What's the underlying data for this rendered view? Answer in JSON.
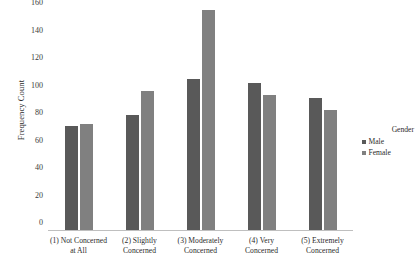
{
  "chart_data": {
    "type": "bar",
    "title": "",
    "xlabel": "",
    "ylabel": "Frequency Count",
    "ylim": [
      0,
      160
    ],
    "yticks": [
      0,
      20,
      40,
      60,
      80,
      100,
      120,
      140,
      160
    ],
    "grid": false,
    "legend_position": "right",
    "legend_title": "Gender",
    "categories": [
      "(1) Not Concerned at All",
      "(2) Slightly Concerned",
      "(3) Moderately Concerned",
      "(4) Very Concerned",
      "(5) Extremely Concerned"
    ],
    "category_lines": [
      [
        "(1) Not Concerned",
        "at All"
      ],
      [
        "(2) Slightly",
        "Concerned"
      ],
      [
        "(3) Moderately",
        "Concerned"
      ],
      [
        "(4) Very",
        "Concerned"
      ],
      [
        "(5) Extremely",
        "Concerned"
      ]
    ],
    "series": [
      {
        "name": "Male",
        "color": "#595959",
        "values": [
          76,
          84,
          110,
          107,
          96
        ]
      },
      {
        "name": "Female",
        "color": "#808080",
        "values": [
          77,
          101,
          160,
          98,
          87
        ]
      }
    ]
  },
  "axis": {
    "y_title": "Frequency Count",
    "tick_labels": [
      "0",
      "20",
      "40",
      "60",
      "80",
      "100",
      "120",
      "140",
      "160"
    ]
  },
  "legend": {
    "title": "Gender",
    "items": [
      {
        "label": "Male"
      },
      {
        "label": "Female"
      }
    ]
  },
  "colors": {
    "male": "#595959",
    "female": "#808080",
    "axis": "#bfbfbf",
    "text": "#2b2b2b",
    "background": "#ffffff"
  }
}
